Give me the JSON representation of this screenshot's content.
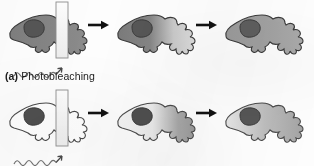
{
  "figure": {
    "title_caption": {
      "tag": "(a)",
      "text": "Photobleaching"
    },
    "background_color": "#fdfdfd",
    "outline_color": "#3a3a3a",
    "arrow_color": "#111111",
    "laser_color": "#8a8a8a",
    "rows": [
      {
        "row_id": "photobleaching-row",
        "label": "(a) Photobleaching",
        "panels": [
          {
            "panel_id": "panel-a1",
            "stage": "before-bleach",
            "cell_fill_description": "uniform dark gray fluorescent cell",
            "fill_left_color": "#7e7e7e",
            "fill_right_color": "#8c8c8c",
            "nucleus_color": "#565656",
            "has_laser_beam": true,
            "has_laser_wave": true
          },
          {
            "panel_id": "panel-a2",
            "stage": "immediately-after-bleach",
            "cell_fill_description": "dark on left, bleached pale region on right",
            "fill_left_color": "#7a7a7a",
            "fill_right_color": "#d8d8d8",
            "nucleus_color": "#565656",
            "has_laser_beam": false,
            "has_laser_wave": false
          },
          {
            "panel_id": "panel-a3",
            "stage": "after-recovery",
            "cell_fill_description": "recovered, nearly uniform medium gray",
            "fill_left_color": "#9a9a9a",
            "fill_right_color": "#a8a8a8",
            "nucleus_color": "#5e5e5e",
            "has_laser_beam": false,
            "has_laser_wave": false
          }
        ],
        "arrows": [
          "arrow-a1",
          "arrow-a2"
        ]
      },
      {
        "row_id": "photoactivation-row",
        "label": "",
        "panels": [
          {
            "panel_id": "panel-b1",
            "stage": "before-activation",
            "cell_fill_description": "unfilled white cell outline, dark nucleus",
            "fill_left_color": "#ffffff",
            "fill_right_color": "#ffffff",
            "nucleus_color": "#4f4f4f",
            "has_laser_beam": true,
            "has_laser_wave": true
          },
          {
            "panel_id": "panel-b2",
            "stage": "immediately-after-activation",
            "cell_fill_description": "pale on left, activated darker region on right",
            "fill_left_color": "#f2f2f2",
            "fill_right_color": "#9d9d9d",
            "nucleus_color": "#4f4f4f",
            "has_laser_beam": false,
            "has_laser_wave": false
          },
          {
            "panel_id": "panel-b3",
            "stage": "after-spreading",
            "cell_fill_description": "spread signal, light-to-medium gray",
            "fill_left_color": "#e2e2e2",
            "fill_right_color": "#a6a6a6",
            "nucleus_color": "#555555",
            "has_laser_beam": false,
            "has_laser_wave": false
          }
        ],
        "arrows": [
          "arrow-b1",
          "arrow-b2"
        ]
      }
    ],
    "icons": {
      "laser_beam": "laser-beam-rectangle-icon",
      "laser_wave": "laser-wave-arrow-icon",
      "process_arrow": "right-arrow-icon",
      "cell": "cell-shape-icon",
      "nucleus": "nucleus-icon"
    }
  }
}
